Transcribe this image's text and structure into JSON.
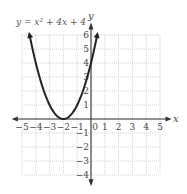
{
  "chart_data": {
    "type": "line",
    "title": "y = x² + 4x + 4",
    "equation_label": "y = x² + 4x + 4",
    "xlabel": "x",
    "ylabel": "y",
    "xlim": [
      -5,
      5
    ],
    "ylim": [
      -4,
      6
    ],
    "grid": true,
    "x_ticks": [
      -5,
      -4,
      -3,
      -2,
      -1,
      0,
      1,
      2,
      3,
      4,
      5
    ],
    "x_tick_labels": [
      "−5",
      "−4",
      "−3",
      "−2",
      "−1",
      "0",
      "1",
      "2",
      "3",
      "4",
      "5"
    ],
    "y_ticks": [
      -4,
      -3,
      -2,
      -1,
      1,
      2,
      3,
      4,
      5,
      6
    ],
    "y_tick_labels": [
      "−4",
      "−3",
      "−2",
      "−1",
      "1",
      "2",
      "3",
      "4",
      "5",
      "6"
    ],
    "series": [
      {
        "name": "y = x² + 4x + 4",
        "x": [
          -4.45,
          -4,
          -3.5,
          -3,
          -2.5,
          -2,
          -1.5,
          -1,
          -0.5,
          0,
          0.45
        ],
        "values": [
          6.0,
          4,
          2.25,
          1,
          0.25,
          0,
          0.25,
          1,
          2.25,
          4,
          6.0
        ],
        "arrows_at_ends": true,
        "vertex": [
          -2,
          0
        ]
      }
    ]
  }
}
